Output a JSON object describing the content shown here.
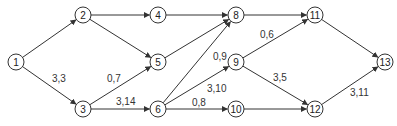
{
  "diagram": {
    "type": "network-graph",
    "directed": true,
    "colors": {
      "stroke": "#333333",
      "text": "#222222",
      "background": "#ffffff"
    },
    "nodes": [
      {
        "id": "1",
        "label": "1",
        "x": 16,
        "y": 62
      },
      {
        "id": "2",
        "label": "2",
        "x": 83,
        "y": 15
      },
      {
        "id": "3",
        "label": "3",
        "x": 83,
        "y": 109
      },
      {
        "id": "4",
        "label": "4",
        "x": 158,
        "y": 15
      },
      {
        "id": "5",
        "label": "5",
        "x": 158,
        "y": 62
      },
      {
        "id": "6",
        "label": "6",
        "x": 158,
        "y": 109
      },
      {
        "id": "8",
        "label": "8",
        "x": 236,
        "y": 15
      },
      {
        "id": "9",
        "label": "9",
        "x": 236,
        "y": 62
      },
      {
        "id": "10",
        "label": "10",
        "x": 236,
        "y": 109
      },
      {
        "id": "11",
        "label": "11",
        "x": 315,
        "y": 15
      },
      {
        "id": "12",
        "label": "12",
        "x": 315,
        "y": 109
      },
      {
        "id": "13",
        "label": "13",
        "x": 385,
        "y": 62
      }
    ],
    "edges": [
      {
        "from": "1",
        "to": "2",
        "label": ""
      },
      {
        "from": "1",
        "to": "3",
        "label": "3,3",
        "lx": 52,
        "ly": 82
      },
      {
        "from": "2",
        "to": "4",
        "label": ""
      },
      {
        "from": "2",
        "to": "5",
        "label": ""
      },
      {
        "from": "3",
        "to": "5",
        "label": "0,7",
        "lx": 107,
        "ly": 82
      },
      {
        "from": "3",
        "to": "6",
        "label": "3,14",
        "lx": 116,
        "ly": 105
      },
      {
        "from": "4",
        "to": "8",
        "label": ""
      },
      {
        "from": "5",
        "to": "8",
        "label": ""
      },
      {
        "from": "6",
        "to": "8",
        "label": "0,9",
        "lx": 213,
        "ly": 60
      },
      {
        "from": "6",
        "to": "9",
        "label": "3,10",
        "lx": 207,
        "ly": 92
      },
      {
        "from": "6",
        "to": "10",
        "label": "0,8",
        "lx": 192,
        "ly": 106
      },
      {
        "from": "8",
        "to": "11",
        "label": ""
      },
      {
        "from": "9",
        "to": "11",
        "label": "0,6",
        "lx": 260,
        "ly": 38
      },
      {
        "from": "9",
        "to": "12",
        "label": "3,5",
        "lx": 273,
        "ly": 81
      },
      {
        "from": "10",
        "to": "12",
        "label": ""
      },
      {
        "from": "11",
        "to": "13",
        "label": ""
      },
      {
        "from": "12",
        "to": "13",
        "label": "3,11",
        "lx": 350,
        "ly": 96
      }
    ]
  }
}
